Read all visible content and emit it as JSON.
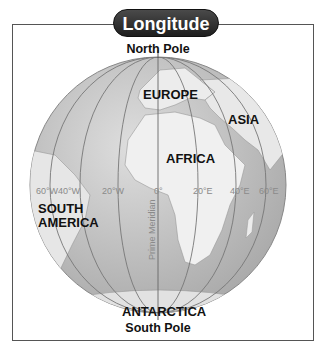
{
  "title": "Longitude",
  "poles": {
    "north": "North Pole",
    "south": "South Pole"
  },
  "continents": {
    "europe": "EUROPE",
    "asia": "ASIA",
    "africa": "AFRICA",
    "south_america_1": "SOUTH",
    "south_america_2": "AMERICA",
    "antarctica": "ANTARCTICA"
  },
  "meridian_label": "Prime Meridian",
  "longitude_ticks": [
    "60°W",
    "40°W",
    "20°W",
    "0°",
    "20°E",
    "40°E",
    "60°E"
  ],
  "colors": {
    "ocean": "#c9c9c9",
    "land": "#ededed",
    "pill": "#2b2b2b",
    "frame": "#555555"
  }
}
